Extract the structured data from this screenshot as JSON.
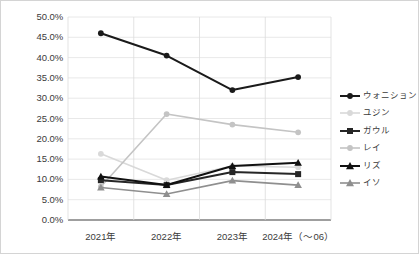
{
  "chart_data": {
    "type": "line",
    "title": "",
    "subtitle": "",
    "xlabel": "",
    "ylabel": "",
    "categories": [
      "2021年",
      "2022年",
      "2023年",
      "2024年（～06）"
    ],
    "ylim": [
      0,
      50
    ],
    "ytick_labels": [
      "0.0%",
      "5.0%",
      "10.0%",
      "15.0%",
      "20.0%",
      "25.0%",
      "30.0%",
      "35.0%",
      "40.0%",
      "45.0%",
      "50.0%"
    ],
    "ytick_values": [
      0,
      5,
      10,
      15,
      20,
      25,
      30,
      35,
      40,
      45,
      50
    ],
    "grid": true,
    "legend_position": "right",
    "series": [
      {
        "name": "ウォニション",
        "color": "#1a1a1a",
        "marker": "circle",
        "width": 2.0,
        "values": [
          46.0,
          40.5,
          32.0,
          35.2
        ]
      },
      {
        "name": "ユジン",
        "color": "#d9d9d9",
        "marker": "circle",
        "width": 1.6,
        "values": [
          16.3,
          9.8,
          13.3,
          13.0
        ]
      },
      {
        "name": "ガウル",
        "color": "#262626",
        "marker": "square",
        "width": 2.0,
        "values": [
          9.8,
          8.6,
          11.8,
          11.3
        ]
      },
      {
        "name": "レイ",
        "color": "#c4c4c4",
        "marker": "circle",
        "width": 1.6,
        "values": [
          8.2,
          26.1,
          23.5,
          21.6
        ]
      },
      {
        "name": "リズ",
        "color": "#111111",
        "marker": "triangle",
        "width": 2.0,
        "values": [
          10.7,
          8.6,
          13.3,
          14.1
        ]
      },
      {
        "name": "イソ",
        "color": "#8f8f8f",
        "marker": "triangle",
        "width": 1.6,
        "values": [
          8.0,
          6.4,
          9.7,
          8.6
        ]
      }
    ]
  },
  "axis": {
    "y_labels": [
      "50.0%",
      "45.0%",
      "40.0%",
      "35.0%",
      "30.0%",
      "25.0%",
      "20.0%",
      "15.0%",
      "10.0%",
      "5.0%",
      "0.0%"
    ],
    "x_labels": [
      "2021年",
      "2022年",
      "2023年",
      "2024年（～06）"
    ]
  },
  "legend": {
    "items": [
      {
        "label": "ウォニション",
        "marker": "circle-dark-icon"
      },
      {
        "label": "ユジン",
        "marker": "circle-light-icon"
      },
      {
        "label": "ガウル",
        "marker": "square-dark-icon"
      },
      {
        "label": "レイ",
        "marker": "circle-gray-icon"
      },
      {
        "label": "リズ",
        "marker": "triangle-dark-icon"
      },
      {
        "label": "イソ",
        "marker": "triangle-gray-icon"
      }
    ]
  }
}
